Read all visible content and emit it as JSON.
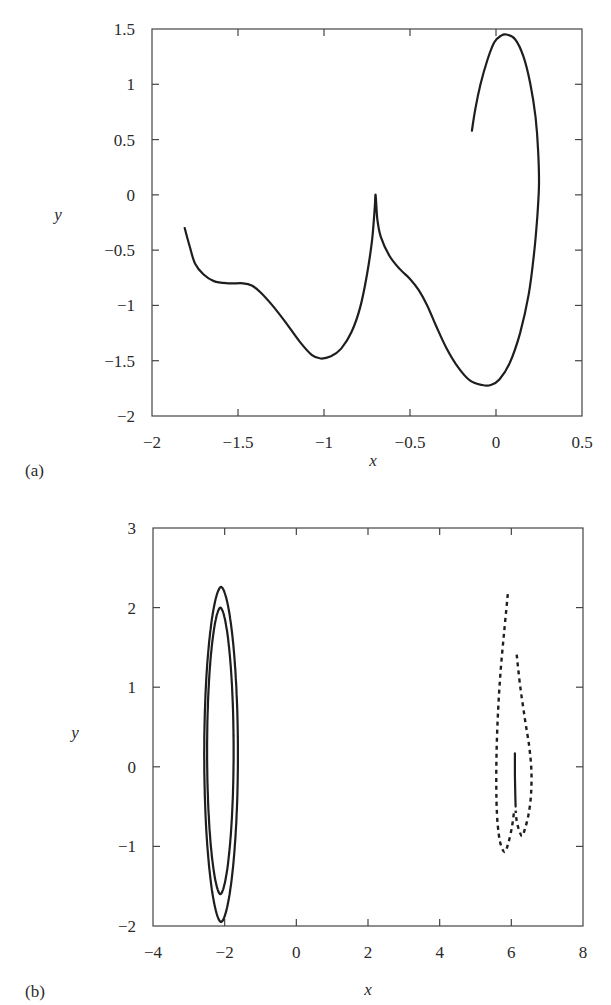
{
  "chart_data": [
    {
      "type": "line",
      "panel_label": "(a)",
      "title": "",
      "xlabel": "x",
      "ylabel": "y",
      "xlim": [
        -2,
        0.5
      ],
      "ylim": [
        -2,
        1.5
      ],
      "xticks": [
        -2,
        -1.5,
        -1,
        -0.5,
        0,
        0.5
      ],
      "xtick_labels": [
        "−2",
        "−1.5",
        "−1",
        "−0.5",
        "0",
        "0.5"
      ],
      "yticks": [
        -2,
        -1.5,
        -1,
        -0.5,
        0,
        0.5,
        1,
        1.5
      ],
      "ytick_labels": [
        "−2",
        "−1.5",
        "−1",
        "−0.5",
        "0",
        "0.5",
        "1",
        "1.5"
      ],
      "grid": false,
      "series": [
        {
          "name": "trajectory",
          "style": "solid",
          "x": [
            -1.81,
            -1.78,
            -1.75,
            -1.7,
            -1.64,
            -1.56,
            -1.47,
            -1.42,
            -1.37,
            -1.3,
            -1.22,
            -1.14,
            -1.07,
            -1.02,
            -0.96,
            -0.9,
            -0.84,
            -0.79,
            -0.75,
            -0.72,
            -0.705,
            -0.7,
            -0.69,
            -0.67,
            -0.62,
            -0.56,
            -0.5,
            -0.45,
            -0.4,
            -0.35,
            -0.29,
            -0.22,
            -0.15,
            -0.08,
            -0.03,
            0.02,
            0.08,
            0.14,
            0.19,
            0.22,
            0.24,
            0.25,
            0.245,
            0.23,
            0.2,
            0.16,
            0.11,
            0.06,
            0.03,
            -0.01,
            -0.05,
            -0.09,
            -0.12,
            -0.14
          ],
          "y": [
            -0.3,
            -0.47,
            -0.62,
            -0.72,
            -0.78,
            -0.8,
            -0.8,
            -0.82,
            -0.88,
            -1.0,
            -1.16,
            -1.33,
            -1.45,
            -1.48,
            -1.46,
            -1.39,
            -1.24,
            -1.02,
            -0.72,
            -0.4,
            -0.12,
            0.0,
            -0.22,
            -0.38,
            -0.55,
            -0.67,
            -0.76,
            -0.86,
            -1.0,
            -1.18,
            -1.38,
            -1.56,
            -1.68,
            -1.72,
            -1.72,
            -1.67,
            -1.52,
            -1.25,
            -0.9,
            -0.55,
            -0.2,
            0.1,
            0.4,
            0.7,
            1.0,
            1.25,
            1.41,
            1.45,
            1.44,
            1.38,
            1.22,
            1.0,
            0.78,
            0.58
          ]
        }
      ]
    },
    {
      "type": "line",
      "panel_label": "(b)",
      "title": "",
      "xlabel": "x",
      "ylabel": "y",
      "xlim": [
        -4,
        8
      ],
      "ylim": [
        -2,
        3
      ],
      "xticks": [
        -4,
        -2,
        0,
        2,
        4,
        6,
        8
      ],
      "xtick_labels": [
        "−4",
        "−2",
        "0",
        "2",
        "4",
        "6",
        "8"
      ],
      "yticks": [
        -2,
        -1,
        0,
        1,
        2,
        3
      ],
      "ytick_labels": [
        "−2",
        "−1",
        "0",
        "1",
        "2",
        "3"
      ],
      "grid": false,
      "series": [
        {
          "name": "outer-loop",
          "style": "solid",
          "center_x": -2.1,
          "center_y": 0.16,
          "x_half_width": 0.47,
          "y_top": 2.26,
          "y_bottom": -1.95
        },
        {
          "name": "inner-loop",
          "style": "solid",
          "center_x": -2.12,
          "center_y": 0.21,
          "x_half_width": 0.37,
          "y_top": 2.0,
          "y_bottom": -1.6
        },
        {
          "name": "dashed-trajectory-left",
          "style": "dashed",
          "x": [
            5.9,
            5.8,
            5.7,
            5.63,
            5.59,
            5.58,
            5.6,
            5.65,
            5.72,
            5.82,
            5.92,
            6.02,
            6.08
          ],
          "y": [
            2.17,
            1.7,
            1.2,
            0.7,
            0.2,
            -0.25,
            -0.6,
            -0.85,
            -1.0,
            -1.07,
            -0.95,
            -0.75,
            -0.55
          ]
        },
        {
          "name": "dashed-trajectory-right",
          "style": "dashed",
          "x": [
            6.15,
            6.25,
            6.38,
            6.5,
            6.56,
            6.55,
            6.48,
            6.38,
            6.3,
            6.22,
            6.15,
            6.12
          ],
          "y": [
            1.41,
            1.0,
            0.6,
            0.25,
            -0.05,
            -0.35,
            -0.6,
            -0.78,
            -0.87,
            -0.8,
            -0.68,
            -0.55
          ]
        },
        {
          "name": "solid-segment",
          "style": "solid",
          "x": [
            6.1,
            6.1,
            6.11,
            6.12
          ],
          "y": [
            0.17,
            -0.1,
            -0.35,
            -0.5
          ]
        }
      ]
    }
  ]
}
